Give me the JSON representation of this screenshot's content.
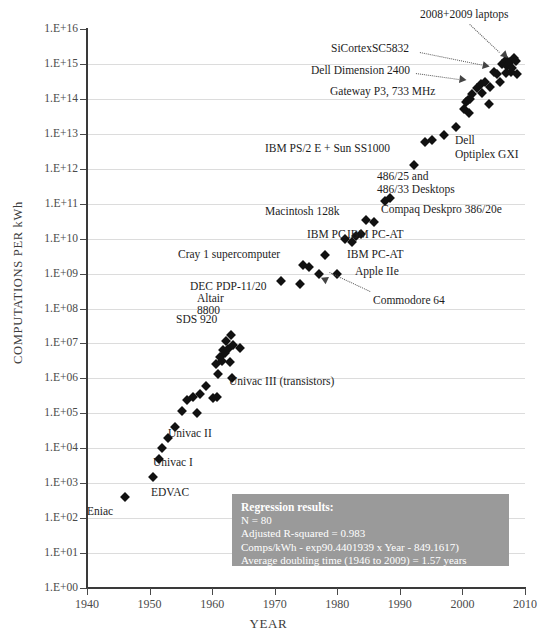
{
  "chart_data": {
    "type": "scatter",
    "title": "",
    "xlabel": "YEAR",
    "ylabel": "COMPUTATIONS PER kWh",
    "xlim": [
      1940,
      2010
    ],
    "ylim": [
      1,
      1e+16
    ],
    "yscale": "log",
    "grid": true,
    "legend": "none",
    "x_ticks": [
      "1940",
      "1950",
      "1960",
      "1970",
      "1980",
      "1990",
      "2000",
      "2010"
    ],
    "y_ticks": [
      "1.E+16",
      "1.E+15",
      "1.E+14",
      "1.E+13",
      "1.E+12",
      "1.E+11",
      "1.E+10",
      "1.E+09",
      "1.E+08",
      "1.E+07",
      "1.E+06",
      "1.E+05",
      "1.E+04",
      "1.E+03",
      "1.E+02",
      "1.E+01",
      "1.E+00"
    ],
    "points": [
      {
        "x": 1946.0,
        "y": 400.0
      },
      {
        "x": 1950.5,
        "y": 1500.0
      },
      {
        "x": 1951.5,
        "y": 5000.0
      },
      {
        "x": 1952.0,
        "y": 10000.0
      },
      {
        "x": 1953.0,
        "y": 20000.0
      },
      {
        "x": 1954.0,
        "y": 40000.0
      },
      {
        "x": 1955.2,
        "y": 120000.0
      },
      {
        "x": 1956.0,
        "y": 240000.0
      },
      {
        "x": 1957.0,
        "y": 300000.0
      },
      {
        "x": 1958.0,
        "y": 350000.0
      },
      {
        "x": 1957.5,
        "y": 100000.0
      },
      {
        "x": 1959.0,
        "y": 600000.0
      },
      {
        "x": 1960.2,
        "y": 280000.0
      },
      {
        "x": 1960.8,
        "y": 300000.0
      },
      {
        "x": 1961.0,
        "y": 1300000.0
      },
      {
        "x": 1961.6,
        "y": 3200000.0
      },
      {
        "x": 1960.6,
        "y": 2600000.0
      },
      {
        "x": 1961.2,
        "y": 4000000.0
      },
      {
        "x": 1962.0,
        "y": 5500000.0
      },
      {
        "x": 1961.8,
        "y": 6500000.0
      },
      {
        "x": 1962.6,
        "y": 7000000.0
      },
      {
        "x": 1962.2,
        "y": 12000000.0
      },
      {
        "x": 1963.0,
        "y": 18000000.0
      },
      {
        "x": 1963.4,
        "y": 9000000.0
      },
      {
        "x": 1964.4,
        "y": 7500000.0
      },
      {
        "x": 1962.8,
        "y": 3000000.0
      },
      {
        "x": 1963.2,
        "y": 1000000.0
      },
      {
        "x": 1971.0,
        "y": 600000000.0
      },
      {
        "x": 1974.6,
        "y": 1800000000.0
      },
      {
        "x": 1975.4,
        "y": 1500000000.0
      },
      {
        "x": 1974.0,
        "y": 500000000.0
      },
      {
        "x": 1977.0,
        "y": 1000000000.0
      },
      {
        "x": 1978.0,
        "y": 3500000000.0
      },
      {
        "x": 1980.0,
        "y": 1000000000.0
      },
      {
        "x": 1981.2,
        "y": 10000000000.0
      },
      {
        "x": 1982.4,
        "y": 8000000000.0
      },
      {
        "x": 1983.0,
        "y": 12000000000.0
      },
      {
        "x": 1983.8,
        "y": 14000000000.0
      },
      {
        "x": 1984.6,
        "y": 35000000000.0
      },
      {
        "x": 1985.8,
        "y": 30000000000.0
      },
      {
        "x": 1987.6,
        "y": 120000000000.0
      },
      {
        "x": 1992.2,
        "y": 1300000000000.0
      },
      {
        "x": 1994.0,
        "y": 6000000000000.0
      },
      {
        "x": 1995.2,
        "y": 6500000000000.0
      },
      {
        "x": 1997.0,
        "y": 9000000000000.0
      },
      {
        "x": 2000.2,
        "y": 50000000000000.0
      },
      {
        "x": 2000.6,
        "y": 80000000000000.0
      },
      {
        "x": 2000.9,
        "y": 90000000000000.0
      },
      {
        "x": 2001.2,
        "y": 100000000000000.0
      },
      {
        "x": 2001.6,
        "y": 140000000000000.0
      },
      {
        "x": 2001.0,
        "y": 40000000000000.0
      },
      {
        "x": 2002.4,
        "y": 200000000000000.0
      },
      {
        "x": 2003.0,
        "y": 260000000000000.0
      },
      {
        "x": 2003.6,
        "y": 300000000000000.0
      },
      {
        "x": 2003.2,
        "y": 150000000000000.0
      },
      {
        "x": 2004.4,
        "y": 220000000000000.0
      },
      {
        "x": 2005.0,
        "y": 600000000000000.0
      },
      {
        "x": 2005.6,
        "y": 500000000000000.0
      },
      {
        "x": 2004.2,
        "y": 70000000000000.0
      },
      {
        "x": 2006.4,
        "y": 1000000000000000.0
      },
      {
        "x": 2006.9,
        "y": 1300000000000000.0
      },
      {
        "x": 2007.2,
        "y": 900000000000000.0
      },
      {
        "x": 2007.6,
        "y": 1100000000000000.0
      },
      {
        "x": 2007.0,
        "y": 550000000000000.0
      },
      {
        "x": 2007.8,
        "y": 600000000000000.0
      },
      {
        "x": 2008.2,
        "y": 1500000000000000.0
      },
      {
        "x": 2008.6,
        "y": 1200000000000000.0
      },
      {
        "x": 2008.0,
        "y": 750000000000000.0
      },
      {
        "x": 2008.8,
        "y": 500000000000000.0
      },
      {
        "x": 2006.0,
        "y": 300000000000000.0
      },
      {
        "x": 1999.0,
        "y": 16000000000000.0
      },
      {
        "x": 1988.4,
        "y": 150000000000.0
      }
    ],
    "annotations": [
      {
        "label": "2008+2009 laptops",
        "x": 2004.0,
        "y": 8000000000000000.0
      },
      {
        "label": "SiCortexSC5832",
        "x": 1995.0,
        "y": 2000000000000000.0
      },
      {
        "label": "Dell Dimension 2400",
        "x": 1992.0,
        "y": 700000000000000.0
      },
      {
        "label": "Gateway P3, 733 MHz",
        "x": 1993.0,
        "y": 200000000000000.0
      },
      {
        "label": "Dell",
        "x": 2001.5,
        "y": 8000000000000.0
      },
      {
        "label": "Optiplex GXI",
        "x": 2001.5,
        "y": 2500000000000.0
      },
      {
        "label": "IBM PS/2 E + Sun SS1000",
        "x": 1985.0,
        "y": 4000000000000.0
      },
      {
        "label": "486/25 and",
        "x": 1995.0,
        "y": 400000000000.0
      },
      {
        "label": "486/33 Desktops",
        "x": 1995.5,
        "y": 150000000000.0
      },
      {
        "label": "Compaq Deskpro 386/20e",
        "x": 1995.0,
        "y": 35000000000.0
      },
      {
        "label": "Macintosh 128k",
        "x": 1981.0,
        "y": 40000000000.0
      },
      {
        "label": "IBM PC",
        "x": 1980.0,
        "y": 11000000000.0
      },
      {
        "label": "IBM PC-AT",
        "x": 1987.0,
        "y": 10000000000.0
      },
      {
        "label": "IBM PC-AT",
        "x": 1987.0,
        "y": 3000000000.0
      },
      {
        "label": "Apple IIe",
        "x": 1988.0,
        "y": 1000000000.0
      },
      {
        "label": "Cray 1 supercomputer",
        "x": 1975.0,
        "y": 3000000000.0
      },
      {
        "label": "DEC PDP-11/20",
        "x": 1967.0,
        "y": 400000000.0
      },
      {
        "label": "Altair",
        "x": 1975.0,
        "y": 200000000.0
      },
      {
        "label": "8800",
        "x": 1975.0,
        "y": 80000000.0
      },
      {
        "label": "Commodore 64",
        "x": 1990.0,
        "y": 200000000.0
      },
      {
        "label": "SDS 920",
        "x": 1961.0,
        "y": 40000000.0
      },
      {
        "label": "Univac III (transistors)",
        "x": 1971.0,
        "y": 1000000.0
      },
      {
        "label": "Univac II",
        "x": 1962.0,
        "y": 20000.0
      },
      {
        "label": "Univac I",
        "x": 1957.0,
        "y": 6000.0
      },
      {
        "label": "EDVAC",
        "x": 1955.0,
        "y": 800.0
      },
      {
        "label": "Eniac",
        "x": 1947.0,
        "y": 200.0
      }
    ],
    "regression": {
      "title": "Regression results:",
      "n": "N = 80",
      "r_squared": "Adjusted R-squared = 0.983",
      "equation": "Comps/kWh - exp90.4401939 x Year - 849.1617)",
      "doubling": "Average doubling time (1946 to 2009) = 1.57 years"
    },
    "colors": {
      "marker": "#111111",
      "grid": "#dcdcdc",
      "axis": "#3a3a3a",
      "text": "#3c3c3c",
      "regression_box_bg": "#9a9a9a",
      "regression_box_text": "#ffffff",
      "background": "#ffffff"
    }
  }
}
